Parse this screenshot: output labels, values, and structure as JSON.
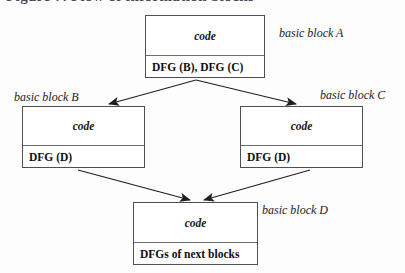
{
  "heading": {
    "text": "Figure 7. Flow of information blocks",
    "clipped": true
  },
  "diagram": {
    "blocks": [
      {
        "id": "A",
        "code_label": "code",
        "dfg_label": "DFG (B), DFG (C)",
        "block_label": "basic block A"
      },
      {
        "id": "B",
        "code_label": "code",
        "dfg_label": "DFG (D)",
        "block_label": "basic block B"
      },
      {
        "id": "C",
        "code_label": "code",
        "dfg_label": "DFG (D)",
        "block_label": "basic block C"
      },
      {
        "id": "D",
        "code_label": "code",
        "dfg_label": "DFGs of next blocks",
        "block_label": "basic block D"
      }
    ],
    "edges": [
      {
        "from": "A",
        "to": "B"
      },
      {
        "from": "A",
        "to": "C"
      },
      {
        "from": "B",
        "to": "D"
      },
      {
        "from": "C",
        "to": "D"
      }
    ],
    "colors": {
      "border": "#4c4f55",
      "divider": "#6a6d73",
      "arrow": "#1d1e20",
      "text": "#0e0f11",
      "background": "#fdfdfd"
    }
  }
}
